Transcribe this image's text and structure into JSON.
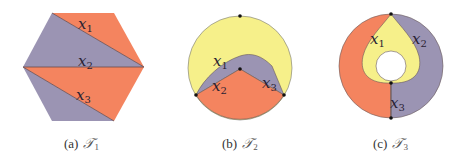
{
  "colors": {
    "orange": "#F4845F",
    "purple": "#9B94B3",
    "yellow": "#F6F08A",
    "edge": "#5a4a4a",
    "dot": "#111111"
  },
  "panels": [
    {
      "id": "a",
      "caption_prefix": "(a)",
      "caption_symbol": "𝒯",
      "caption_index": "1",
      "shape": "hexagon",
      "labels": [
        {
          "base": "x",
          "sub": "1"
        },
        {
          "base": "x",
          "sub": "2"
        },
        {
          "base": "x",
          "sub": "3"
        }
      ]
    },
    {
      "id": "b",
      "caption_prefix": "(b)",
      "caption_symbol": "𝒯",
      "caption_index": "2",
      "shape": "disk",
      "labels": [
        {
          "base": "x",
          "sub": "1"
        },
        {
          "base": "x",
          "sub": "2"
        },
        {
          "base": "x",
          "sub": "3"
        }
      ]
    },
    {
      "id": "c",
      "caption_prefix": "(c)",
      "caption_symbol": "𝒯",
      "caption_index": "3",
      "shape": "annulus",
      "labels": [
        {
          "base": "x",
          "sub": "1"
        },
        {
          "base": "x",
          "sub": "2"
        },
        {
          "base": "x",
          "sub": "3"
        }
      ]
    }
  ]
}
